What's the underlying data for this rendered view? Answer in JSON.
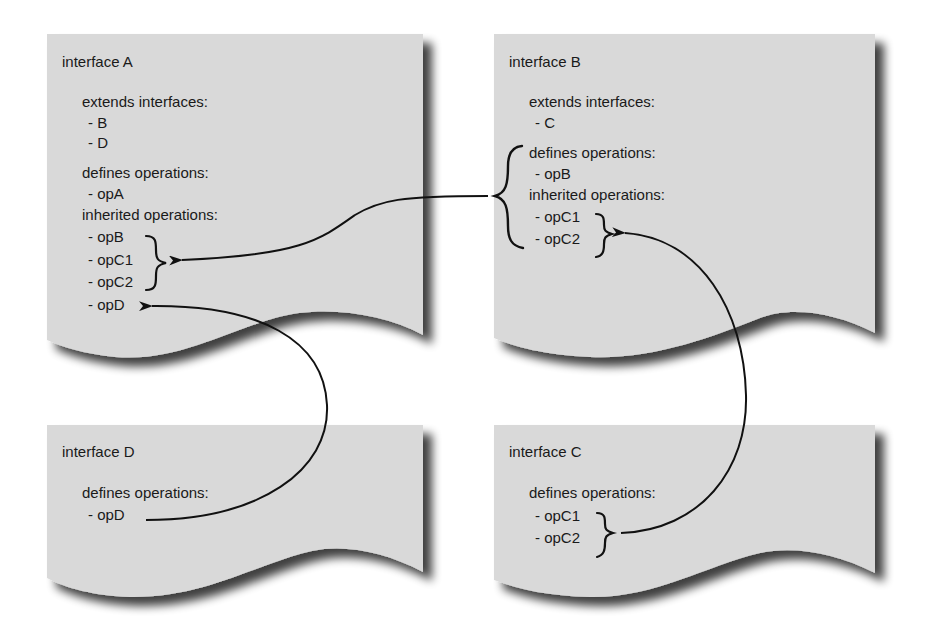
{
  "diagram": {
    "colors": {
      "page_fill": "#d9d9d9",
      "page_shadow": "#6e6e6e",
      "text": "#1a1a1a",
      "arrow": "#111111",
      "background": "#ffffff"
    },
    "interfaces": {
      "A": {
        "title": "interface A",
        "extends_heading": "extends interfaces:",
        "extends": [
          "- B",
          "- D"
        ],
        "defines_heading": "defines operations:",
        "defines": [
          "- opA"
        ],
        "inherited_heading": "inherited operations:",
        "inherited": [
          "- opB",
          "- opC1",
          "- opC2",
          "- opD"
        ]
      },
      "B": {
        "title": "interface B",
        "extends_heading": "extends interfaces:",
        "extends": [
          "- C"
        ],
        "defines_heading": "defines operations:",
        "defines": [
          "- opB"
        ],
        "inherited_heading": "inherited operations:",
        "inherited": [
          "- opC1",
          "- opC2"
        ]
      },
      "C": {
        "title": "interface C",
        "defines_heading": "defines operations:",
        "defines": [
          "- opC1",
          "- opC2"
        ]
      },
      "D": {
        "title": "interface D",
        "defines_heading": "defines operations:",
        "defines": [
          "- opD"
        ]
      }
    },
    "connections": [
      {
        "from": "interface B (all operations: opB, opC1, opC2)",
        "to": "interface A inherited opB, opC1, opC2"
      },
      {
        "from": "interface D opD",
        "to": "interface A inherited opD"
      },
      {
        "from": "interface C opC1, opC2",
        "to": "interface B inherited opC1, opC2"
      }
    ]
  }
}
